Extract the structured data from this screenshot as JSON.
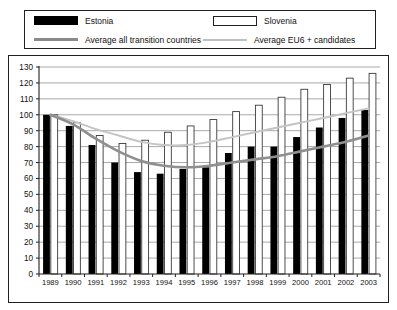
{
  "legend": {
    "items": [
      {
        "name": "estonia",
        "label": "Estonia",
        "marker": "filled-black-rect",
        "color": "#000000"
      },
      {
        "name": "slovenia",
        "label": "Slovenia",
        "marker": "outlined-white-rect",
        "color": "#ffffff"
      },
      {
        "name": "average-all-transition-countries",
        "label": "Average all transition countries",
        "marker": "thick-gray-line",
        "color": "#8a8a8a"
      },
      {
        "name": "average-eu6-candidates",
        "label": "Average EU6 + candidates",
        "marker": "thin-lightgray-line",
        "color": "#c0c0c0"
      }
    ]
  },
  "chart_data": {
    "type": "bar",
    "title": "",
    "xlabel": "",
    "ylabel": "",
    "ylim": [
      0,
      130
    ],
    "ytick_step": 10,
    "yticks": [
      0,
      10,
      20,
      30,
      40,
      50,
      60,
      70,
      80,
      90,
      100,
      110,
      120,
      130
    ],
    "grid": true,
    "legend_position": "top",
    "categories": [
      "1989",
      "1990",
      "1991",
      "1992",
      "1993",
      "1994",
      "1995",
      "1996",
      "1997",
      "1998",
      "1999",
      "2000",
      "2001",
      "2002",
      "2003"
    ],
    "series": [
      {
        "name": "Estonia",
        "kind": "bar",
        "color": "#000000",
        "values": [
          100,
          93,
          81,
          70,
          64,
          63,
          66,
          67,
          76,
          80,
          80,
          86,
          92,
          98,
          103
        ]
      },
      {
        "name": "Slovenia",
        "kind": "bar",
        "color": "#ffffff",
        "values": [
          100,
          95,
          87,
          82,
          84,
          89,
          93,
          97,
          102,
          106,
          111,
          116,
          119,
          123,
          126
        ]
      },
      {
        "name": "Average all transition countries",
        "kind": "line",
        "color": "#8f8f8f",
        "values": [
          100,
          94,
          85,
          77,
          71,
          68,
          67,
          68,
          70,
          72,
          74,
          77,
          80,
          83,
          87
        ]
      },
      {
        "name": "Average EU6 + candidates",
        "kind": "line",
        "color": "#c4c4c4",
        "values": [
          100,
          96,
          91,
          87,
          83,
          81,
          81,
          83,
          86,
          89,
          92,
          95,
          98,
          101,
          104
        ]
      }
    ]
  }
}
